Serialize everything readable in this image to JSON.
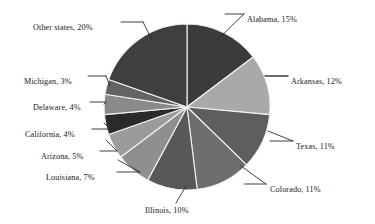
{
  "chart_data": {
    "type": "pie",
    "title": "",
    "subtitle": "",
    "xlabel": "",
    "ylabel": "",
    "legend_position": "none",
    "grid": false,
    "units": "percent",
    "total": 100,
    "start_angle_deg": 0,
    "direction": "clockwise",
    "categories": [
      "Alabama",
      "Arkansas",
      "Texas",
      "Colorado",
      "Illinois",
      "Louisiana",
      "Arizona",
      "California",
      "Delaware",
      "Michigan",
      "Other states"
    ],
    "values": [
      15,
      12,
      11,
      11,
      10,
      7,
      5,
      4,
      4,
      3,
      20
    ],
    "colors": [
      "#3b3b3b",
      "#a9a9a9",
      "#5e5e5e",
      "#6e6e6e",
      "#585858",
      "#8f8f8f",
      "#9b9b9b",
      "#2a2a2a",
      "#8a8a8a",
      "#636363",
      "#3f3f3f"
    ],
    "slices": [
      {
        "label": "Alabama, 15%",
        "name": "Alabama",
        "value": 15,
        "color": "#3b3b3b"
      },
      {
        "label": "Arkansas, 12%",
        "name": "Arkansas",
        "value": 12,
        "color": "#a9a9a9"
      },
      {
        "label": "Texas, 11%",
        "name": "Texas",
        "value": 11,
        "color": "#5e5e5e"
      },
      {
        "label": "Colorado, 11%",
        "name": "Colorado",
        "value": 11,
        "color": "#6e6e6e"
      },
      {
        "label": "Illinois, 10%",
        "name": "Illinois",
        "value": 10,
        "color": "#585858"
      },
      {
        "label": "Louisiana, 7%",
        "name": "Louisiana",
        "value": 7,
        "color": "#8f8f8f"
      },
      {
        "label": "Arizona, 5%",
        "name": "Arizona",
        "value": 5,
        "color": "#9b9b9b"
      },
      {
        "label": "California, 4%",
        "name": "California",
        "value": 4,
        "color": "#2a2a2a"
      },
      {
        "label": "Delaware, 4%",
        "name": "Delaware",
        "value": 4,
        "color": "#8a8a8a"
      },
      {
        "label": "Michigan, 3%",
        "name": "Michigan",
        "value": 3,
        "color": "#636363"
      },
      {
        "label": "Other states, 20%",
        "name": "Other states",
        "value": 20,
        "color": "#3f3f3f"
      }
    ]
  },
  "geometry": {
    "center_x": 187,
    "center_y": 107,
    "radius": 83
  },
  "style": {
    "background": "#ffffff",
    "text_color": "#1a1a1a",
    "leader_color": "#2b2b2b",
    "slice_border": "#f2f2f2"
  },
  "labels": {
    "alabama": {
      "text": "Alabama, 15%",
      "left": 247,
      "top": 16,
      "align": "label-right"
    },
    "arkansas": {
      "text": "Arkansas, 12%",
      "left": 291,
      "top": 78,
      "align": "label-right"
    },
    "texas": {
      "text": "Texas, 11%",
      "left": 296,
      "top": 143,
      "align": "label-right"
    },
    "colorado": {
      "text": "Colorado, 11%",
      "left": 270,
      "top": 186,
      "align": "label-right"
    },
    "illinois": {
      "text": "Illinois, 10%",
      "left": 145,
      "top": 207,
      "align": "label-center"
    },
    "louisiana": {
      "text": "Louisiana, 7%",
      "left": 46,
      "top": 174,
      "align": "label-left"
    },
    "arizona": {
      "text": "Arizona, 5%",
      "left": 41,
      "top": 153,
      "align": "label-left"
    },
    "california": {
      "text": "California, 4%",
      "left": 25,
      "top": 131,
      "align": "label-left"
    },
    "delaware": {
      "text": "Delaware, 4%",
      "left": 33,
      "top": 104,
      "align": "label-left"
    },
    "michigan": {
      "text": "Michigan, 3%",
      "left": 24,
      "top": 78,
      "align": "label-left"
    },
    "other_states": {
      "text": "Other states, 20%",
      "left": 33,
      "top": 24,
      "align": "label-left"
    }
  }
}
